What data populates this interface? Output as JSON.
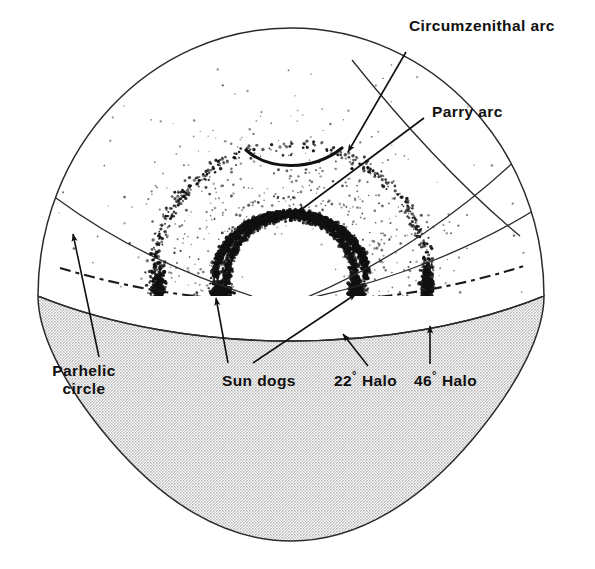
{
  "figure": {
    "type": "diagram",
    "background_color": "#ffffff",
    "ink_color": "#101010",
    "ground_color": "#d9d9d9"
  },
  "labels": {
    "circumzenithal_arc": "Circumzenithal arc",
    "parry_arc": "Parry arc",
    "parhelic_circle_line1": "Parhelic",
    "parhelic_circle_line2": "circle",
    "sun_dogs": "Sun dogs",
    "halo_22_value": "22",
    "halo_22_degree": "°",
    "halo_22_word": "Halo",
    "halo_46_value": "46",
    "halo_46_degree": "°",
    "halo_46_word": "Halo"
  },
  "features": [
    {
      "name": "circumzenithal-arc",
      "label": "Circumzenithal arc",
      "description": "Thin concave-up arc high in the sky above the sun"
    },
    {
      "name": "parry-arc",
      "label": "Parry arc",
      "description": "Dense stippled arc resting on top of the 22 degree halo"
    },
    {
      "name": "parhelic-circle",
      "label": "Parhelic circle",
      "description": "Horizontal dash-dot circle passing through the sun at sun altitude"
    },
    {
      "name": "sun-dogs",
      "label": "Sun dogs",
      "description": "Bright concentrations on the parhelic circle either side of the sun"
    },
    {
      "name": "halo-22",
      "label": "22° Halo",
      "description": "Inner stippled ring of radius 22 degrees about the sun"
    },
    {
      "name": "halo-46",
      "label": "46° Halo",
      "description": "Outer faint stippled ring of radius 46 degrees about the sun"
    },
    {
      "name": "horizon",
      "label": "Horizon",
      "description": "Arc separating the white sky dome from the shaded ground"
    }
  ]
}
